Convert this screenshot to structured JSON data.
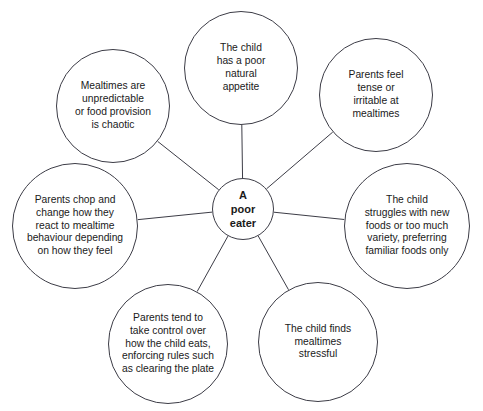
{
  "diagram": {
    "type": "spoke-and-hub mind map",
    "center": {
      "id": "a-poor-eater",
      "label": "A\npoor\neater",
      "cx": 243,
      "cy": 209,
      "r": 31
    },
    "line_color": "#3c3c46",
    "background_color": "#ffffff",
    "text_color": "#1a1a1a",
    "nodes": [
      {
        "id": "mealtimes-unpredictable",
        "label": "Mealtimes are\nunpredictable\nor food provision\nis chaotic",
        "cx": 113,
        "cy": 106,
        "r": 57,
        "position": "top-left"
      },
      {
        "id": "poor-natural-appetite",
        "label": "The child\nhas a poor\nnatural\nappetite",
        "cx": 241,
        "cy": 68,
        "r": 57,
        "position": "top-center"
      },
      {
        "id": "parents-feel-tense",
        "label": "Parents feel\ntense or\nirritable at\nmealtimes",
        "cx": 376,
        "cy": 95,
        "r": 57,
        "position": "top-right"
      },
      {
        "id": "struggles-with-new-foods",
        "label": "The child\nstruggles with new\nfoods or too much\nvariety, preferring\nfamiliar foods only",
        "cx": 407,
        "cy": 226,
        "r": 63,
        "position": "right"
      },
      {
        "id": "child-finds-mealtimes-stressful",
        "label": "The child finds\nmealtimes\nstressful",
        "cx": 318,
        "cy": 342,
        "r": 60,
        "position": "bottom-right"
      },
      {
        "id": "parents-take-control",
        "label": "Parents tend to\ntake control over\nhow the child eats,\nenforcing rules such\nas clearing the plate",
        "cx": 168,
        "cy": 344,
        "r": 60,
        "position": "bottom-center"
      },
      {
        "id": "parents-chop-and-change",
        "label": "Parents chop and\nchange how they\nreact to mealtime\nbehaviour depending\non how they feel",
        "cx": 75,
        "cy": 226,
        "r": 63,
        "position": "left"
      }
    ]
  }
}
